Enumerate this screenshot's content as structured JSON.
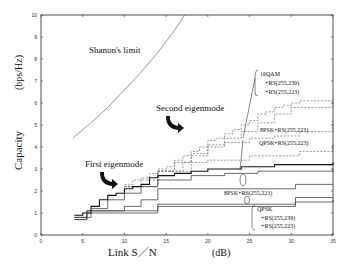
{
  "chart_data": {
    "type": "line",
    "title": "",
    "xlabel": "Link S／N",
    "xunit": "(dB)",
    "ylabel": "Capacity",
    "yunit": "(bps/Hz)",
    "xlim": [
      0,
      35
    ],
    "ylim": [
      0,
      10
    ],
    "xticks": [
      0,
      5,
      10,
      15,
      20,
      25,
      30,
      35
    ],
    "yticks": [
      0,
      1,
      2,
      3,
      4,
      5,
      6,
      7,
      8,
      9,
      10
    ],
    "grid": false,
    "annotations": {
      "shannon": "Shanon's limit",
      "first": "First eigenmode",
      "second": "Second eigenmode",
      "qam16_1": "16QAM",
      "qam16_2": "+RS(255,239)",
      "qam16_3": "+RS(255,223)",
      "psk8_dashed": "8PSK+RS(255,223)",
      "qpsk_dashed": "QPSK+RS(255,223)",
      "psk8_solid": "8PSK+RS(255,223)",
      "qpsk_1": "QPSK",
      "qpsk_2": "+RS(255,239)",
      "qpsk_3": "+RS(255,223)"
    },
    "series": [
      {
        "name": "Shanon's limit",
        "style": "solid-thin",
        "x": [
          3.8,
          6,
          8,
          10,
          12,
          14,
          16,
          17.2
        ],
        "y": [
          4.4,
          5.1,
          5.8,
          6.6,
          7.4,
          8.3,
          9.3,
          10.0
        ]
      },
      {
        "name": "Second eigenmode 16QAM+RS(255,239)",
        "style": "dashed",
        "x": [
          10,
          11,
          12,
          13,
          14,
          15,
          16,
          17,
          18,
          19,
          20,
          21,
          22,
          23,
          24,
          25,
          26,
          27,
          28,
          29,
          30,
          31,
          35
        ],
        "y": [
          2.3,
          2.5,
          2.6,
          2.8,
          3.0,
          3.1,
          3.4,
          3.6,
          3.8,
          4.0,
          4.3,
          4.4,
          4.6,
          4.8,
          5.0,
          5.2,
          5.5,
          5.6,
          5.8,
          5.9,
          6.0,
          6.1,
          6.1
        ]
      },
      {
        "name": "Second eigenmode 16QAM+RS(255,223)",
        "style": "dashed",
        "x": [
          10,
          12,
          14,
          16,
          18,
          20,
          22,
          24,
          26,
          28,
          30,
          35
        ],
        "y": [
          2.2,
          2.5,
          2.9,
          3.3,
          3.7,
          4.1,
          4.4,
          4.7,
          5.1,
          5.5,
          5.8,
          6.0
        ]
      },
      {
        "name": "Second eigenmode 8PSK+RS(255,223)",
        "style": "dashed",
        "x": [
          10,
          14,
          18,
          20,
          22,
          25,
          28,
          31,
          35
        ],
        "y": [
          2.2,
          2.9,
          3.6,
          4.0,
          4.2,
          4.4,
          4.5,
          4.7,
          5.3
        ]
      },
      {
        "name": "Second eigenmode QPSK+RS(255,223)",
        "style": "dashed",
        "x": [
          10,
          14,
          17,
          20,
          25,
          31,
          35
        ],
        "y": [
          2.2,
          2.9,
          3.3,
          3.4,
          3.6,
          3.8,
          4.2
        ]
      },
      {
        "name": "First eigenmode 16QAM+RS(255,239)",
        "style": "solid-bold",
        "x": [
          4,
          5,
          6,
          7,
          8,
          9,
          10,
          11,
          12,
          13,
          14,
          16,
          18,
          20,
          22,
          24,
          26,
          28,
          30,
          35
        ],
        "y": [
          0.9,
          1.0,
          1.3,
          1.6,
          1.8,
          1.9,
          2.1,
          2.2,
          2.3,
          2.6,
          2.7,
          2.8,
          2.9,
          3.0,
          3.0,
          3.1,
          3.1,
          3.2,
          3.2,
          3.3
        ]
      },
      {
        "name": "First eigenmode 16QAM+RS(255,223)",
        "style": "solid",
        "x": [
          4,
          6,
          8,
          10,
          12,
          14,
          18,
          22,
          26,
          30,
          35
        ],
        "y": [
          0.8,
          1.2,
          1.6,
          1.9,
          2.2,
          2.5,
          2.7,
          2.8,
          2.9,
          2.9,
          3.0
        ]
      },
      {
        "name": "First eigenmode 8PSK+RS(255,223)",
        "style": "solid",
        "x": [
          4,
          5.5,
          10,
          12,
          14,
          22,
          30.5,
          35
        ],
        "y": [
          0.8,
          1.1,
          1.3,
          1.6,
          2.1,
          2.1,
          2.3,
          2.3
        ]
      },
      {
        "name": "First eigenmode QPSK+RS(255,239)",
        "style": "solid",
        "x": [
          4,
          5.5,
          12,
          14,
          30.5,
          35
        ],
        "y": [
          0.7,
          1.1,
          1.1,
          1.4,
          1.7,
          1.7
        ]
      },
      {
        "name": "First eigenmode QPSK+RS(255,223)",
        "style": "solid",
        "x": [
          4,
          5.5,
          12,
          14,
          30.5,
          35
        ],
        "y": [
          0.7,
          1.0,
          1.0,
          1.3,
          1.5,
          1.6
        ]
      }
    ]
  }
}
